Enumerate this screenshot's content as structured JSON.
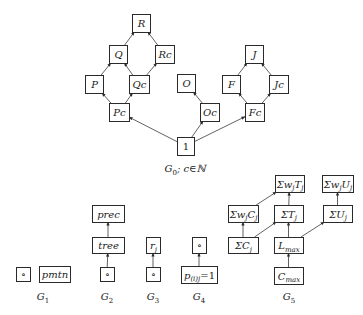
{
  "diagram": {
    "colors": {
      "stroke": "#2a2a2a",
      "text": "#1a1a1a",
      "background": "#ffffff"
    },
    "graphs": [
      {
        "id": "G0",
        "label": "G",
        "label_sub": "0",
        "label_suffix": "; c∈ℕ",
        "nodes": [
          {
            "id": "R",
            "text": "R"
          },
          {
            "id": "Q",
            "text": "Q"
          },
          {
            "id": "Rc",
            "text": "Rc"
          },
          {
            "id": "P",
            "text": "P"
          },
          {
            "id": "Qc",
            "text": "Qc"
          },
          {
            "id": "Pc",
            "text": "Pc"
          },
          {
            "id": "O",
            "text": "O"
          },
          {
            "id": "Oc",
            "text": "Oc"
          },
          {
            "id": "I",
            "text": "1"
          },
          {
            "id": "J",
            "text": "J"
          },
          {
            "id": "F",
            "text": "F"
          },
          {
            "id": "Jc",
            "text": "Jc"
          },
          {
            "id": "Fc",
            "text": "Fc"
          }
        ],
        "edges": [
          [
            "Q",
            "R"
          ],
          [
            "Rc",
            "R"
          ],
          [
            "P",
            "Q"
          ],
          [
            "Qc",
            "Q"
          ],
          [
            "Qc",
            "Rc"
          ],
          [
            "Pc",
            "P"
          ],
          [
            "Pc",
            "Qc"
          ],
          [
            "Oc",
            "O"
          ],
          [
            "I",
            "Pc"
          ],
          [
            "I",
            "Oc"
          ],
          [
            "I",
            "Fc"
          ],
          [
            "F",
            "J"
          ],
          [
            "Jc",
            "J"
          ],
          [
            "Fc",
            "F"
          ],
          [
            "Fc",
            "Jc"
          ]
        ]
      },
      {
        "id": "G1",
        "label": "G",
        "label_sub": "1",
        "nodes": [
          {
            "id": "g1o",
            "text": "∘"
          },
          {
            "id": "pmtn",
            "text": "pmtn"
          }
        ],
        "edges": []
      },
      {
        "id": "G2",
        "label": "G",
        "label_sub": "2",
        "nodes": [
          {
            "id": "prec",
            "text": "prec"
          },
          {
            "id": "tree",
            "text": "tree"
          },
          {
            "id": "g2o",
            "text": "∘"
          }
        ],
        "edges": [
          [
            "g2o",
            "tree"
          ],
          [
            "tree",
            "prec"
          ]
        ]
      },
      {
        "id": "G3",
        "label": "G",
        "label_sub": "3",
        "nodes": [
          {
            "id": "rj",
            "text": "r",
            "sub": "j"
          },
          {
            "id": "g3o",
            "text": "∘"
          }
        ],
        "edges": [
          [
            "g3o",
            "rj"
          ]
        ]
      },
      {
        "id": "G4",
        "label": "G",
        "label_sub": "4",
        "nodes": [
          {
            "id": "g4o",
            "text": "∘"
          },
          {
            "id": "pij",
            "text": "p",
            "sub": "(i)j",
            "suffix": "=1"
          }
        ],
        "edges": [
          [
            "pij",
            "g4o"
          ]
        ]
      },
      {
        "id": "G5",
        "label": "G",
        "label_sub": "5",
        "nodes": [
          {
            "id": "swT",
            "text": "Σw",
            "sub": "j",
            "text2": "T",
            "sub2": "j"
          },
          {
            "id": "swU",
            "text": "Σw",
            "sub": "j",
            "text2": "U",
            "sub2": "j"
          },
          {
            "id": "swC",
            "text": "Σw",
            "sub": "j",
            "text2": "C",
            "sub2": "j"
          },
          {
            "id": "sT",
            "text": "ΣT",
            "sub": "j"
          },
          {
            "id": "sU",
            "text": "ΣU",
            "sub": "j"
          },
          {
            "id": "sC",
            "text": "ΣC",
            "sub": "j"
          },
          {
            "id": "Lmax",
            "text": "L",
            "sub": "max"
          },
          {
            "id": "Cmax",
            "text": "C",
            "sub": "max"
          }
        ],
        "edges": [
          [
            "swC",
            "swT"
          ],
          [
            "sT",
            "swT"
          ],
          [
            "sU",
            "swU"
          ],
          [
            "sC",
            "swC"
          ],
          [
            "sC",
            "sT"
          ],
          [
            "Lmax",
            "sT"
          ],
          [
            "Lmax",
            "sU"
          ],
          [
            "Cmax",
            "Lmax"
          ]
        ]
      }
    ]
  }
}
